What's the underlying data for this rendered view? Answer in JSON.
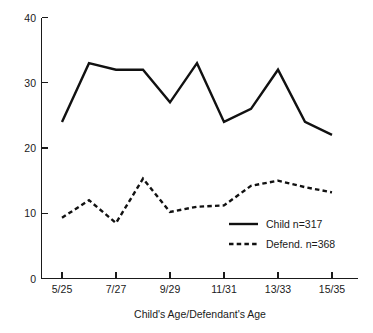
{
  "chart_data": {
    "type": "line",
    "title": "",
    "xlabel": "Child's Age/Defendant's Age",
    "ylabel": "",
    "categories": [
      "5/25",
      "6/26",
      "7/27",
      "8/28",
      "9/29",
      "10/30",
      "11/31",
      "12/32",
      "13/33",
      "14/34",
      "15/35"
    ],
    "x_tick_labels": [
      "5/25",
      "7/27",
      "9/29",
      "11/31",
      "13/33",
      "15/35"
    ],
    "y_tick_labels": [
      "0",
      "10",
      "20",
      "30",
      "40"
    ],
    "y_ticks": [
      0,
      10,
      20,
      30,
      40
    ],
    "ylim": [
      0,
      40
    ],
    "grid": false,
    "legend_position": "center-right",
    "series": [
      {
        "name": "Child n=317",
        "style": "solid",
        "color": "#111111",
        "values": [
          24,
          33,
          32,
          32,
          27,
          33,
          24,
          26,
          32,
          24,
          22
        ]
      },
      {
        "name": "Defend. n=368",
        "style": "dashed",
        "color": "#111111",
        "values": [
          9.3,
          12,
          8.5,
          15.3,
          10.2,
          11,
          11.2,
          14.2,
          15,
          14,
          13.2
        ]
      }
    ]
  },
  "axes": {
    "x_title": "Child's Age/Defendant's Age",
    "y_tick_0": "0",
    "y_tick_1": "10",
    "y_tick_2": "20",
    "y_tick_3": "30",
    "y_tick_4": "40",
    "x_tick_0": "5/25",
    "x_tick_1": "7/27",
    "x_tick_2": "9/29",
    "x_tick_3": "11/31",
    "x_tick_4": "13/33",
    "x_tick_5": "15/35"
  },
  "legend": {
    "entry_child": "Child n=317",
    "entry_defendant": "Defend. n=368"
  }
}
